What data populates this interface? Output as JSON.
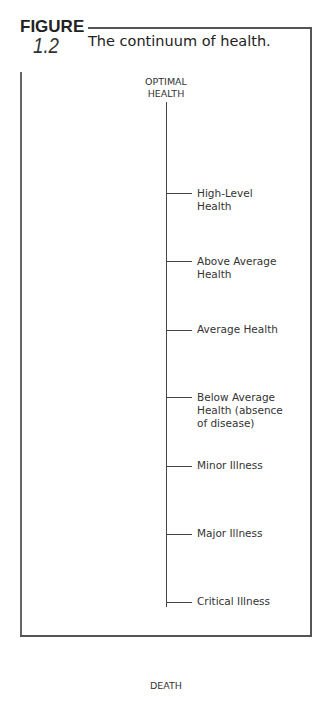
{
  "figure": {
    "label": "FIGURE",
    "number": "1.2",
    "caption": "The continuum of health."
  },
  "diagram": {
    "top_label_line1": "OPTIMAL",
    "top_label_line2": "HEALTH",
    "bottom_label": "DEATH",
    "levels": [
      {
        "label": "High-Level Health",
        "tick_y": 193
      },
      {
        "label": "Above Average Health",
        "tick_y": 260
      },
      {
        "label": "Average Health",
        "tick_y": 329
      },
      {
        "label": "Below Average Health (absence of disease)",
        "tick_y": 397
      },
      {
        "label": "Minor Illness",
        "tick_y": 466
      },
      {
        "label": "Major Illness",
        "tick_y": 534
      },
      {
        "label": "Critical Illness",
        "tick_y": 602
      }
    ]
  }
}
